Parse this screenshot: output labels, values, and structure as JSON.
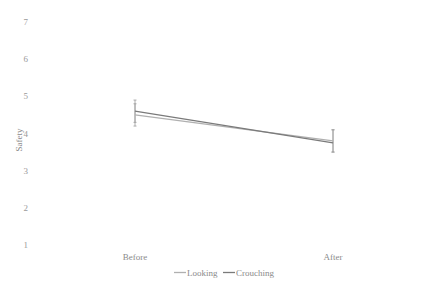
{
  "chart_data": {
    "type": "line",
    "title": "",
    "xlabel": "",
    "ylabel": "Safety",
    "ylim": [
      1,
      7
    ],
    "yticks": [
      1,
      2,
      3,
      4,
      5,
      6,
      7
    ],
    "categories": [
      "Before",
      "After"
    ],
    "grid": false,
    "legend_position": "bottom",
    "series": [
      {
        "name": "Looking",
        "values": [
          4.5,
          3.8
        ],
        "error_low": [
          4.2,
          3.5
        ],
        "error_high": [
          4.8,
          4.1
        ],
        "color": "#b0b0b0"
      },
      {
        "name": "Crouching",
        "values": [
          4.6,
          3.75
        ],
        "error_low": [
          4.3,
          3.5
        ],
        "error_high": [
          4.9,
          4.1
        ],
        "color": "#7a7a7a"
      }
    ]
  }
}
